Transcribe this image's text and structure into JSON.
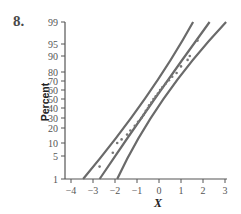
{
  "figure": {
    "number": "8."
  },
  "chart_data": {
    "type": "scatter",
    "subtype": "normal probability plot with confidence bands",
    "title": "",
    "xlabel": "X",
    "ylabel": "Percent",
    "xlim": [
      -4,
      3
    ],
    "x_ticks": [
      -4,
      -3,
      -2,
      -1,
      0,
      1,
      2,
      3
    ],
    "y_ticks": [
      1,
      5,
      10,
      20,
      30,
      40,
      50,
      60,
      70,
      80,
      90,
      95,
      99
    ],
    "y_scale": "normal probability",
    "grid": false,
    "legend": null,
    "lines": [
      {
        "name": "lower-band",
        "points": [
          [
            -3.45,
            1
          ],
          [
            -0.65,
            50
          ],
          [
            1.55,
            99
          ]
        ]
      },
      {
        "name": "fit-line",
        "points": [
          [
            -2.7,
            1
          ],
          [
            -0.2,
            50
          ],
          [
            2.3,
            99
          ]
        ]
      },
      {
        "name": "upper-band",
        "points": [
          [
            -1.9,
            1
          ],
          [
            0.2,
            50
          ],
          [
            3.05,
            99
          ]
        ]
      }
    ],
    "points": [
      [
        -2.7,
        2.5
      ],
      [
        -2.1,
        6
      ],
      [
        -1.9,
        10
      ],
      [
        -1.7,
        12
      ],
      [
        -1.45,
        15
      ],
      [
        -1.3,
        18
      ],
      [
        -1.1,
        22
      ],
      [
        -0.95,
        26
      ],
      [
        -0.8,
        30
      ],
      [
        -0.7,
        33
      ],
      [
        -0.6,
        37
      ],
      [
        -0.5,
        40
      ],
      [
        -0.45,
        43
      ],
      [
        -0.35,
        46
      ],
      [
        -0.25,
        50
      ],
      [
        -0.15,
        53
      ],
      [
        -0.05,
        56
      ],
      [
        0.05,
        60
      ],
      [
        0.15,
        63
      ],
      [
        0.3,
        67
      ],
      [
        0.45,
        71
      ],
      [
        0.6,
        75
      ],
      [
        0.8,
        79
      ],
      [
        1.0,
        84
      ],
      [
        1.3,
        88
      ],
      [
        1.4,
        90
      ],
      [
        1.75,
        96
      ]
    ]
  },
  "axis": {
    "x_tick_labels": [
      "−4",
      "−3",
      "−2",
      "−1",
      "0",
      "1",
      "2",
      "3"
    ],
    "y_tick_labels": [
      "1",
      "5",
      "10",
      "20",
      "30",
      "40",
      "50",
      "60",
      "70",
      "80",
      "90",
      "95",
      "99"
    ]
  },
  "colors": {
    "axis": "#555555",
    "line": "#6a6a6a",
    "point": "#777777",
    "text": "#555555"
  }
}
